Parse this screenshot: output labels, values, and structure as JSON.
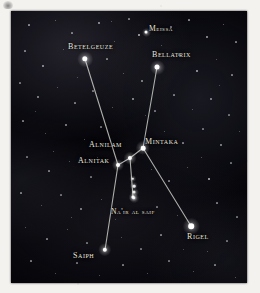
{
  "plate": {
    "title": "Orion constellation star chart",
    "panel": {
      "x": 11,
      "y": 11,
      "width": 236,
      "height": 272,
      "background": "#05050a"
    },
    "colors": {
      "page": "#f3f2ef",
      "sky": "#05050a",
      "star": "#ffffff",
      "label_text": "#e9e7de",
      "constellation_line": "#cfd2c9"
    }
  },
  "chart_data": {
    "type": "scatter",
    "xlabel": "",
    "ylabel": "",
    "grid": false,
    "legend": "none",
    "coordinate_space": "panel pixels, origin at panel top-left, 236x272",
    "stars": [
      {
        "name": "Meissa",
        "label": "Meissa",
        "x": 135,
        "y": 21,
        "size": 3.0,
        "label_x": 138,
        "label_y": 14,
        "font_size": 7.6
      },
      {
        "name": "Betelgeuze",
        "label": "Betelgeuze",
        "x": 74,
        "y": 48,
        "size": 5.4,
        "label_x": 57,
        "label_y": 32,
        "font_size": 8.0
      },
      {
        "name": "Bellatrix",
        "label": "Bellatrix",
        "x": 146,
        "y": 56,
        "size": 5.0,
        "label_x": 141,
        "label_y": 40,
        "font_size": 8.0
      },
      {
        "name": "Mintaka",
        "label": "Mintaka",
        "x": 132,
        "y": 137,
        "size": 4.6,
        "label_x": 134,
        "label_y": 127,
        "font_size": 8.0
      },
      {
        "name": "Alnilam",
        "label": "Alnilam",
        "x": 119,
        "y": 147,
        "size": 4.2,
        "label_x": 78,
        "label_y": 130,
        "font_size": 8.0
      },
      {
        "name": "Alnitak",
        "label": "Alnitak",
        "x": 107,
        "y": 154,
        "size": 4.0,
        "label_x": 67,
        "label_y": 146,
        "font_size": 8.0
      },
      {
        "name": "Nair al saif",
        "label": "Na'ir al saif",
        "x": 122,
        "y": 186,
        "size": 3.2,
        "label_x": 100,
        "label_y": 197,
        "font_size": 7.6
      },
      {
        "name": "Saiph",
        "label": "Saiph",
        "x": 94,
        "y": 239,
        "size": 4.4,
        "label_x": 62,
        "label_y": 241,
        "font_size": 8.0
      },
      {
        "name": "Rigel",
        "label": "Rigel",
        "x": 180,
        "y": 215,
        "size": 5.6,
        "label_x": 176,
        "label_y": 222,
        "font_size": 8.0
      }
    ],
    "sword_chain": [
      {
        "x": 122,
        "y": 168,
        "size": 2.4
      },
      {
        "x": 123,
        "y": 175,
        "size": 2.6
      },
      {
        "x": 123,
        "y": 181,
        "size": 3.0
      },
      {
        "x": 123,
        "y": 187,
        "size": 3.4
      }
    ],
    "constellation_lines": [
      {
        "from": "Betelgeuze",
        "to": "Alnitak",
        "x1": 74,
        "y1": 48,
        "x2": 107,
        "y2": 154
      },
      {
        "from": "Bellatrix",
        "to": "Mintaka",
        "x1": 146,
        "y1": 56,
        "x2": 132,
        "y2": 137
      },
      {
        "from": "Mintaka",
        "to": "Alnilam",
        "x1": 132,
        "y1": 137,
        "x2": 119,
        "y2": 147
      },
      {
        "from": "Alnilam",
        "to": "Alnitak",
        "x1": 119,
        "y1": 147,
        "x2": 107,
        "y2": 154
      },
      {
        "from": "Alnitak",
        "to": "Saiph",
        "x1": 107,
        "y1": 154,
        "x2": 94,
        "y2": 239
      },
      {
        "from": "Mintaka",
        "to": "Rigel",
        "x1": 132,
        "y1": 137,
        "x2": 180,
        "y2": 215
      },
      {
        "from": "Alnilam",
        "to": "Nair al saif",
        "x1": 119,
        "y1": 147,
        "x2": 122,
        "y2": 186
      }
    ],
    "background_stars": [
      {
        "x": 18,
        "y": 14,
        "s": 1.2,
        "o": 0.55
      },
      {
        "x": 44,
        "y": 9,
        "s": 1.0,
        "o": 0.45
      },
      {
        "x": 61,
        "y": 22,
        "s": 1.1,
        "o": 0.5
      },
      {
        "x": 88,
        "y": 12,
        "s": 1.3,
        "o": 0.6
      },
      {
        "x": 103,
        "y": 30,
        "s": 1.0,
        "o": 0.4
      },
      {
        "x": 118,
        "y": 8,
        "s": 1.1,
        "o": 0.5
      },
      {
        "x": 128,
        "y": 24,
        "s": 1.6,
        "o": 0.7
      },
      {
        "x": 160,
        "y": 16,
        "s": 1.1,
        "o": 0.5
      },
      {
        "x": 178,
        "y": 9,
        "s": 1.2,
        "o": 0.55
      },
      {
        "x": 196,
        "y": 26,
        "s": 1.3,
        "o": 0.6
      },
      {
        "x": 212,
        "y": 13,
        "s": 1.0,
        "o": 0.45
      },
      {
        "x": 225,
        "y": 31,
        "s": 1.2,
        "o": 0.5
      },
      {
        "x": 14,
        "y": 40,
        "s": 1.1,
        "o": 0.5
      },
      {
        "x": 32,
        "y": 55,
        "s": 1.4,
        "o": 0.6
      },
      {
        "x": 52,
        "y": 38,
        "s": 1.0,
        "o": 0.4
      },
      {
        "x": 96,
        "y": 48,
        "s": 1.2,
        "o": 0.5
      },
      {
        "x": 112,
        "y": 62,
        "s": 1.0,
        "o": 0.4
      },
      {
        "x": 131,
        "y": 70,
        "s": 1.3,
        "o": 0.55
      },
      {
        "x": 168,
        "y": 44,
        "s": 1.1,
        "o": 0.5
      },
      {
        "x": 186,
        "y": 60,
        "s": 1.5,
        "o": 0.65
      },
      {
        "x": 205,
        "y": 48,
        "s": 1.0,
        "o": 0.4
      },
      {
        "x": 221,
        "y": 64,
        "s": 1.2,
        "o": 0.5
      },
      {
        "x": 9,
        "y": 72,
        "s": 1.1,
        "o": 0.45
      },
      {
        "x": 27,
        "y": 86,
        "s": 1.3,
        "o": 0.55
      },
      {
        "x": 46,
        "y": 76,
        "s": 1.0,
        "o": 0.4
      },
      {
        "x": 64,
        "y": 92,
        "s": 1.2,
        "o": 0.5
      },
      {
        "x": 82,
        "y": 80,
        "s": 1.1,
        "o": 0.45
      },
      {
        "x": 101,
        "y": 96,
        "s": 1.0,
        "o": 0.4
      },
      {
        "x": 122,
        "y": 88,
        "s": 1.4,
        "o": 0.6
      },
      {
        "x": 144,
        "y": 100,
        "s": 1.1,
        "o": 0.45
      },
      {
        "x": 163,
        "y": 84,
        "s": 1.2,
        "o": 0.5
      },
      {
        "x": 181,
        "y": 98,
        "s": 1.0,
        "o": 0.4
      },
      {
        "x": 200,
        "y": 88,
        "s": 1.3,
        "o": 0.55
      },
      {
        "x": 218,
        "y": 104,
        "s": 1.1,
        "o": 0.45
      },
      {
        "x": 12,
        "y": 110,
        "s": 1.2,
        "o": 0.5
      },
      {
        "x": 34,
        "y": 122,
        "s": 1.0,
        "o": 0.4
      },
      {
        "x": 55,
        "y": 114,
        "s": 1.3,
        "o": 0.55
      },
      {
        "x": 73,
        "y": 128,
        "s": 1.0,
        "o": 0.4
      },
      {
        "x": 90,
        "y": 116,
        "s": 1.1,
        "o": 0.45
      },
      {
        "x": 153,
        "y": 120,
        "s": 1.0,
        "o": 0.4
      },
      {
        "x": 172,
        "y": 132,
        "s": 1.2,
        "o": 0.5
      },
      {
        "x": 192,
        "y": 118,
        "s": 1.1,
        "o": 0.45
      },
      {
        "x": 210,
        "y": 134,
        "s": 1.3,
        "o": 0.55
      },
      {
        "x": 228,
        "y": 120,
        "s": 1.0,
        "o": 0.4
      },
      {
        "x": 16,
        "y": 146,
        "s": 1.1,
        "o": 0.45
      },
      {
        "x": 38,
        "y": 160,
        "s": 1.2,
        "o": 0.5
      },
      {
        "x": 58,
        "y": 150,
        "s": 1.0,
        "o": 0.4
      },
      {
        "x": 80,
        "y": 166,
        "s": 1.1,
        "o": 0.45
      },
      {
        "x": 140,
        "y": 158,
        "s": 1.0,
        "o": 0.4
      },
      {
        "x": 158,
        "y": 170,
        "s": 1.2,
        "o": 0.5
      },
      {
        "x": 176,
        "y": 156,
        "s": 1.0,
        "o": 0.4
      },
      {
        "x": 198,
        "y": 168,
        "s": 2.0,
        "o": 0.8
      },
      {
        "x": 220,
        "y": 152,
        "s": 1.1,
        "o": 0.45
      },
      {
        "x": 10,
        "y": 182,
        "s": 1.2,
        "o": 0.5
      },
      {
        "x": 30,
        "y": 194,
        "s": 1.0,
        "o": 0.4
      },
      {
        "x": 50,
        "y": 184,
        "s": 1.1,
        "o": 0.45
      },
      {
        "x": 70,
        "y": 198,
        "s": 1.3,
        "o": 0.55
      },
      {
        "x": 90,
        "y": 188,
        "s": 1.0,
        "o": 0.4
      },
      {
        "x": 146,
        "y": 196,
        "s": 1.1,
        "o": 0.45
      },
      {
        "x": 166,
        "y": 204,
        "s": 1.0,
        "o": 0.4
      },
      {
        "x": 206,
        "y": 192,
        "s": 1.2,
        "o": 0.5
      },
      {
        "x": 226,
        "y": 206,
        "s": 1.1,
        "o": 0.45
      },
      {
        "x": 14,
        "y": 216,
        "s": 1.0,
        "o": 0.4
      },
      {
        "x": 36,
        "y": 228,
        "s": 1.2,
        "o": 0.5
      },
      {
        "x": 56,
        "y": 218,
        "s": 1.0,
        "o": 0.4
      },
      {
        "x": 76,
        "y": 232,
        "s": 1.1,
        "o": 0.45
      },
      {
        "x": 110,
        "y": 226,
        "s": 1.0,
        "o": 0.4
      },
      {
        "x": 130,
        "y": 238,
        "s": 1.1,
        "o": 0.45
      },
      {
        "x": 150,
        "y": 224,
        "s": 1.2,
        "o": 0.5
      },
      {
        "x": 196,
        "y": 240,
        "s": 1.0,
        "o": 0.4
      },
      {
        "x": 216,
        "y": 230,
        "s": 1.1,
        "o": 0.45
      },
      {
        "x": 20,
        "y": 250,
        "s": 1.2,
        "o": 0.5
      },
      {
        "x": 44,
        "y": 262,
        "s": 1.0,
        "o": 0.4
      },
      {
        "x": 66,
        "y": 252,
        "s": 1.1,
        "o": 0.45
      },
      {
        "x": 88,
        "y": 264,
        "s": 1.0,
        "o": 0.4
      },
      {
        "x": 112,
        "y": 254,
        "s": 1.2,
        "o": 0.5
      },
      {
        "x": 136,
        "y": 262,
        "s": 1.0,
        "o": 0.4
      },
      {
        "x": 158,
        "y": 250,
        "s": 1.1,
        "o": 0.45
      },
      {
        "x": 182,
        "y": 260,
        "s": 1.0,
        "o": 0.4
      },
      {
        "x": 204,
        "y": 254,
        "s": 1.2,
        "o": 0.5
      },
      {
        "x": 224,
        "y": 266,
        "s": 1.0,
        "o": 0.4
      },
      {
        "x": 100,
        "y": 10,
        "s": 1.0,
        "o": 0.4
      },
      {
        "x": 66,
        "y": 66,
        "s": 1.0,
        "o": 0.35
      },
      {
        "x": 150,
        "y": 34,
        "s": 1.0,
        "o": 0.4
      },
      {
        "x": 24,
        "y": 100,
        "s": 1.0,
        "o": 0.35
      },
      {
        "x": 190,
        "y": 146,
        "s": 1.0,
        "o": 0.4
      },
      {
        "x": 104,
        "y": 208,
        "s": 1.0,
        "o": 0.35
      },
      {
        "x": 172,
        "y": 238,
        "s": 1.0,
        "o": 0.35
      },
      {
        "x": 60,
        "y": 206,
        "s": 1.0,
        "o": 0.4
      },
      {
        "x": 134,
        "y": 104,
        "s": 1.0,
        "o": 0.35
      },
      {
        "x": 208,
        "y": 74,
        "s": 1.0,
        "o": 0.35
      },
      {
        "x": 42,
        "y": 140,
        "s": 1.0,
        "o": 0.4
      },
      {
        "x": 86,
        "y": 146,
        "s": 1.0,
        "o": 0.35
      }
    ]
  }
}
